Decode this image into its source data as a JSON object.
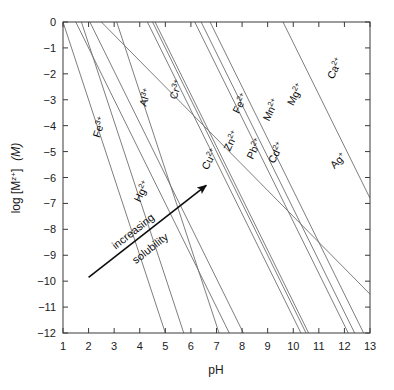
{
  "chart_data": {
    "type": "line",
    "title": "",
    "xlabel": "pH",
    "ylabel": "log [M^z+]  (M)",
    "ylabel_parts": {
      "lead": "log [M",
      "sup": "z+",
      "close": "]",
      "units": "(M)"
    },
    "xlim": [
      1,
      13
    ],
    "ylim": [
      -12,
      0
    ],
    "xticks": [
      1,
      2,
      3,
      4,
      5,
      6,
      7,
      8,
      9,
      10,
      11,
      12,
      13
    ],
    "xtick_labels": [
      "1",
      "2",
      "3",
      "4",
      "5",
      "6",
      "7",
      "8",
      "9",
      "10",
      "11",
      "12",
      "13"
    ],
    "yticks": [
      0,
      -1,
      -2,
      -3,
      -4,
      -5,
      -6,
      -7,
      -8,
      -9,
      -10,
      -11,
      -12
    ],
    "ytick_labels": [
      "0",
      "−1",
      "−2",
      "−3",
      "−4",
      "−5",
      "−6",
      "−7",
      "−8",
      "−9",
      "−10",
      "−11",
      "−12"
    ],
    "grid": false,
    "legend": "inline-labels",
    "line_color": "#6f6f6f",
    "axis_color": "#3a3a3a",
    "text_color": "#0d0d0d",
    "annotations": [
      {
        "name": "increasing-solubility-arrow",
        "text_line1": "increasing",
        "text_line2": "solubility",
        "x_start": 2.0,
        "y_start": -9.85,
        "x_end": 6.6,
        "y_end": -6.3
      }
    ],
    "series": [
      {
        "name": "Fe3+",
        "label_base": "Fe",
        "label_sup": "3+",
        "charge": 3,
        "points": [
          [
            1.0,
            0.0
          ],
          [
            5.0,
            -12.0
          ]
        ],
        "label_x": 2.55,
        "label_y": -4.1
      },
      {
        "name": "Al3+",
        "label_base": "Al",
        "label_sup": "3+",
        "charge": 3,
        "points": [
          [
            1.72,
            0.0
          ],
          [
            5.72,
            -12.0
          ]
        ],
        "label_x": 4.35,
        "label_y": -2.95
      },
      {
        "name": "Cr3+",
        "label_base": "Cr",
        "label_sup": "3+",
        "charge": 3,
        "points": [
          [
            3.1,
            0.0
          ],
          [
            7.1,
            -12.0
          ]
        ],
        "label_x": 5.55,
        "label_y": -2.65
      },
      {
        "name": "Hg2+",
        "label_base": "Hg",
        "label_sup": "2+",
        "charge": 2,
        "points": [
          [
            1.5,
            0.0
          ],
          [
            7.5,
            -12.0
          ]
        ],
        "label_x": 4.2,
        "label_y": -6.6
      },
      {
        "name": "Cu2+",
        "label_base": "Cu",
        "label_sup": "2+",
        "charge": 2,
        "points": [
          [
            2.05,
            0.0
          ],
          [
            8.05,
            -12.0
          ]
        ],
        "label_x": 6.85,
        "label_y": -5.35
      },
      {
        "name": "Fe2+",
        "label_base": "Fe",
        "label_sup": "2+",
        "charge": 2,
        "points": [
          [
            4.3,
            0.0
          ],
          [
            10.3,
            -12.0
          ]
        ],
        "label_x": 8.05,
        "label_y": -3.2
      },
      {
        "name": "Zn2+",
        "label_base": "Zn",
        "label_sup": "2+",
        "charge": 2,
        "points": [
          [
            4.5,
            0.0
          ],
          [
            10.5,
            -12.0
          ]
        ],
        "label_x": 7.7,
        "label_y": -4.65
      },
      {
        "name": "Pb2+",
        "label_base": "Pb",
        "label_sup": "2+",
        "charge": 2,
        "points": [
          [
            4.6,
            0.0
          ],
          [
            10.6,
            -12.0
          ]
        ],
        "label_x": 8.6,
        "label_y": -4.95
      },
      {
        "name": "Mn2+",
        "label_base": "Mn",
        "label_sup": "2+",
        "charge": 2,
        "points": [
          [
            6.15,
            0.0
          ],
          [
            12.15,
            -12.0
          ]
        ],
        "label_x": 9.25,
        "label_y": -3.45
      },
      {
        "name": "Cd2+",
        "label_base": "Cd",
        "label_sup": "2+",
        "charge": 2,
        "points": [
          [
            6.4,
            0.0
          ],
          [
            12.4,
            -12.0
          ]
        ],
        "label_x": 9.45,
        "label_y": -5.1
      },
      {
        "name": "Mg2+",
        "label_base": "Mg",
        "label_sup": "2+",
        "charge": 2,
        "points": [
          [
            6.75,
            0.0
          ],
          [
            12.75,
            -12.0
          ]
        ],
        "label_x": 10.2,
        "label_y": -2.85
      },
      {
        "name": "Ca2+",
        "label_base": "Ca",
        "label_sup": "2+",
        "charge": 2,
        "points": [
          [
            9.6,
            0.0
          ],
          [
            13.0,
            -6.8
          ]
        ],
        "label_x": 11.75,
        "label_y": -1.85
      },
      {
        "name": "Ag+",
        "label_base": "Ag",
        "label_sup": "+",
        "charge": 1,
        "points": [
          [
            1.0,
            1.5
          ],
          [
            13.0,
            -10.5
          ]
        ],
        "label_x": 11.85,
        "label_y": -5.45
      }
    ]
  },
  "axes_geometry": {
    "left_px": 63,
    "right_px": 370,
    "top_px": 22,
    "bottom_px": 333
  }
}
